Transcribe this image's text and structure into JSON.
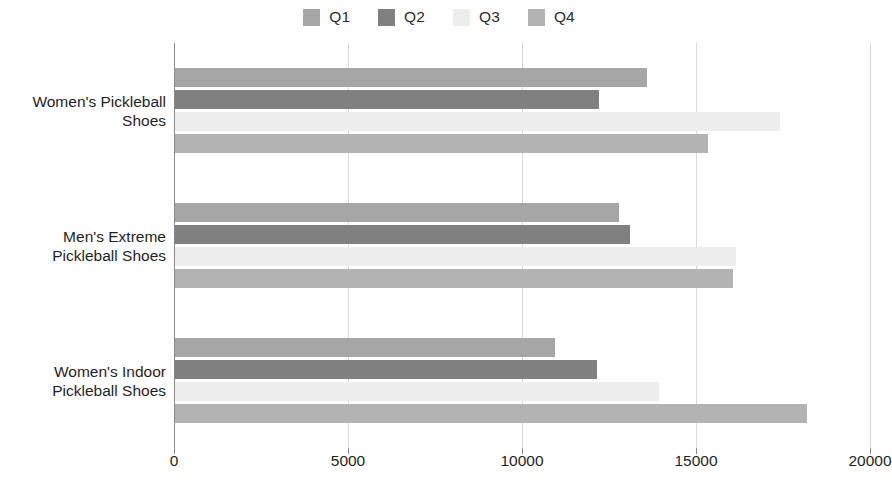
{
  "chart_data": {
    "type": "bar",
    "orientation": "horizontal",
    "title": "",
    "xlabel": "",
    "ylabel": "",
    "grid": true,
    "legend_position": "top-center",
    "categories": [
      "Women's Pickleball\nShoes",
      "Men's Extreme\nPickleball Shoes",
      "Women's Indoor\nPickleball Shoes"
    ],
    "series": [
      {
        "name": "Q1",
        "color": "#a6a6a6",
        "values": [
          13600,
          12800,
          10950
        ]
      },
      {
        "name": "Q2",
        "color": "#808080",
        "values": [
          12200,
          13100,
          12150
        ]
      },
      {
        "name": "Q3",
        "color": "#ededed",
        "values": [
          17400,
          16150,
          13950
        ]
      },
      {
        "name": "Q4",
        "color": "#b3b3b3",
        "values": [
          15350,
          16050,
          18200
        ]
      }
    ],
    "xlim": [
      0,
      20000
    ],
    "x_ticks": [
      0,
      5000,
      10000,
      15000,
      20000
    ],
    "x_tick_labels": [
      "0",
      "5000",
      "10000",
      "15000",
      "20000"
    ]
  },
  "legend": {
    "entries": [
      {
        "label": "Q1"
      },
      {
        "label": "Q2"
      },
      {
        "label": "Q3"
      },
      {
        "label": "Q4"
      }
    ]
  },
  "colors": {
    "q1": "#a6a6a6",
    "q2": "#808080",
    "q3": "#ededed",
    "q4": "#b3b3b3",
    "axis": "#8a8a8a",
    "grid": "#d9d9d9",
    "text": "#1f1f1f",
    "background": "#ffffff"
  }
}
